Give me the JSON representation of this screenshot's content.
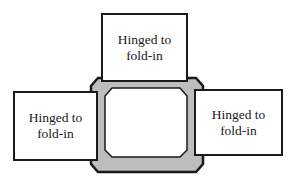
{
  "diagram": {
    "frame": {
      "fill": "#bdbdbd",
      "stroke": "#1a1a1a",
      "window_fill": "#ffffff"
    },
    "flaps": [
      {
        "position": "top",
        "line1": "Hinged to",
        "line2": "fold-in"
      },
      {
        "position": "left",
        "line1": "Hinged to",
        "line2": "fold-in"
      },
      {
        "position": "right",
        "line1": "Hinged to",
        "line2": "fold-in"
      }
    ]
  }
}
